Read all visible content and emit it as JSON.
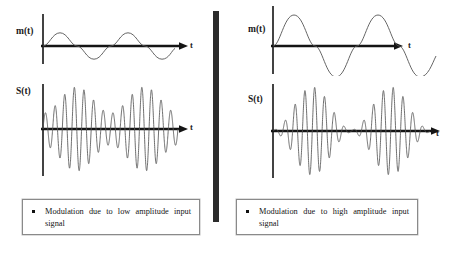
{
  "figure": {
    "divider_color": "#2b2b2b",
    "stroke_color": "#3a3a3a",
    "axis_color": "#141414"
  },
  "panels": [
    {
      "id": "left",
      "message_plot": {
        "y_label": "m(t)",
        "x_label": "t"
      },
      "signal_plot": {
        "y_label": "S(t)",
        "x_label": "t"
      },
      "callout": {
        "bullet": "square-bullet",
        "text": "Modulation due to low  amplitude input signal"
      }
    },
    {
      "id": "right",
      "message_plot": {
        "y_label": "m(t)",
        "x_label": "t"
      },
      "signal_plot": {
        "y_label": "S(t)",
        "x_label": "t"
      },
      "callout": {
        "bullet": "square-bullet",
        "text": "Modulation due to high amplitude input signal"
      }
    }
  ],
  "chart_data": [
    {
      "type": "line",
      "id": "left-message-signal",
      "title": "m(t)",
      "xlabel": "t",
      "ylabel": "m(t)",
      "description": "Low amplitude sinusoidal message signal, about two cycles",
      "amplitude": 0.35,
      "cycles": 2,
      "xlim": [
        0,
        1
      ],
      "ylim": [
        -1,
        1
      ],
      "grid": false
    },
    {
      "type": "line",
      "id": "left-modulated-signal",
      "title": "S(t)",
      "xlabel": "t",
      "ylabel": "S(t)",
      "description": "Amplitude modulated carrier with low modulation index; envelope never reaches zero",
      "carrier_cycles": 14,
      "envelope_cycles": 2,
      "modulation_index": 0.45,
      "xlim": [
        0,
        1
      ],
      "ylim": [
        -1,
        1
      ],
      "grid": false
    },
    {
      "type": "line",
      "id": "right-message-signal",
      "title": "m(t)",
      "xlabel": "t",
      "ylabel": "m(t)",
      "description": "High amplitude sinusoidal message signal, about two cycles",
      "amplitude": 0.95,
      "cycles": 2,
      "xlim": [
        0,
        1
      ],
      "ylim": [
        -1,
        1
      ],
      "grid": false
    },
    {
      "type": "line",
      "id": "right-modulated-signal",
      "title": "S(t)",
      "xlabel": "t",
      "ylabel": "S(t)",
      "description": "Amplitude modulated carrier with high modulation index; envelope approaches zero at troughs",
      "carrier_cycles": 16,
      "envelope_cycles": 2,
      "modulation_index": 0.95,
      "xlim": [
        0,
        1
      ],
      "ylim": [
        -1,
        1
      ],
      "grid": false
    }
  ]
}
